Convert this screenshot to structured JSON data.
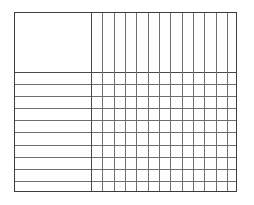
{
  "document": {
    "type": "blank-table-grid",
    "title": "",
    "description": "Empty table skeleton with no text content"
  },
  "table": {
    "frame": {
      "left": 14,
      "top": 12,
      "right": 237,
      "bottom": 192,
      "width": 223,
      "height": 180,
      "border_color": "#3d3d3d",
      "rule_color": "#6e6e6e",
      "background": "#ffffff"
    },
    "header": {
      "label_cell": {
        "text": "",
        "left": 0,
        "top": 0,
        "width": 76,
        "height": 59
      },
      "height": 59,
      "column_labels": [
        "",
        "",
        "",
        "",
        "",
        "",
        "",
        "",
        "",
        "",
        "",
        "",
        ""
      ]
    },
    "label_column": {
      "header_text": "",
      "width": 76,
      "divider_x": 76
    },
    "columns": {
      "count": 13,
      "start_x": 76,
      "width": 11.3,
      "dividers_x": [
        76,
        87,
        99,
        110,
        121,
        133,
        144,
        155,
        167,
        178,
        189,
        201,
        212,
        223
      ],
      "values": [
        "",
        "",
        "",
        "",
        "",
        "",
        "",
        "",
        "",
        "",
        "",
        "",
        ""
      ]
    },
    "rows": {
      "count": 10,
      "body_top": 59,
      "body_height": 121,
      "dividers_y": [
        59,
        71,
        83,
        95,
        107,
        119,
        132,
        144,
        156,
        168,
        180
      ],
      "labels": [
        "",
        "",
        "",
        "",
        "",
        "",
        "",
        "",
        "",
        ""
      ]
    },
    "cells": {
      "text": "",
      "filled": false,
      "total": 130
    }
  }
}
